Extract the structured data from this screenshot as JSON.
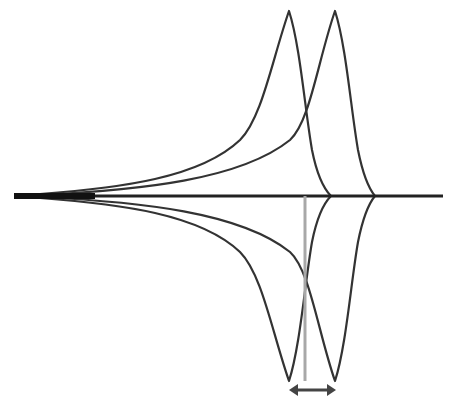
{
  "diagram": {
    "colors": {
      "curve": "#333333",
      "baseline": "#222222",
      "marker": "#a8a8a8",
      "arrow": "#444444",
      "background": "#ffffff"
    },
    "baseline": {
      "x_start": 14,
      "x_end": 443,
      "y": 196
    },
    "peaks_upper": [
      {
        "name": "peak-1",
        "x": 289,
        "y": 11,
        "end_x": 331
      },
      {
        "name": "peak-2",
        "x": 335,
        "y": 11,
        "end_x": 375
      }
    ],
    "troughs_lower": [
      {
        "name": "trough-1",
        "x": 289,
        "y": 381
      },
      {
        "name": "trough-2",
        "x": 335,
        "y": 381
      }
    ],
    "marker_line": {
      "x": 305,
      "y_start": 196,
      "y_end": 381
    },
    "shift_arrow": {
      "x_start": 290,
      "x_end": 335,
      "y": 390
    }
  }
}
